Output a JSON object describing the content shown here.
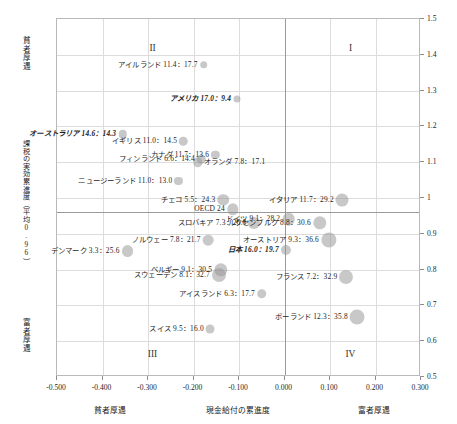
{
  "chart_data": {
    "type": "scatter",
    "title": "",
    "xlabel": "現金給付の累進度",
    "ylabel": "課税の実効累進度（平均0.96）",
    "xlim": [
      -0.5,
      0.3
    ],
    "ylim": [
      0.5,
      1.5
    ],
    "xticks": [
      "-0.500",
      "-0.400",
      "-0.300",
      "-0.200",
      "-0.100",
      "0.000",
      "0.100",
      "0.200",
      "0.300"
    ],
    "xtick_values": [
      -0.5,
      -0.4,
      -0.3,
      -0.2,
      -0.1,
      0.0,
      0.1,
      0.2,
      0.3
    ],
    "yticks": [
      "1.5",
      "1.4",
      "1.3",
      "1.2",
      "1.1",
      "1",
      "0.9",
      "0.8",
      "0.7",
      "0.6",
      "0.5"
    ],
    "ytick_values": [
      1.5,
      1.4,
      1.3,
      1.2,
      1.1,
      1.0,
      0.9,
      0.8,
      0.7,
      0.6,
      0.5
    ],
    "grid": true,
    "legend": "none",
    "reference_lines": {
      "x": 0.0,
      "y": 0.96
    },
    "axis_annotations": {
      "x_left": "貧者厚遇",
      "x_right": "富者厚遇",
      "y_top": "貧者厚遇",
      "y_bottom": "富者厚遇"
    },
    "quadrants": [
      {
        "label": "I",
        "x": 0.145,
        "y": 1.42
      },
      {
        "label": "II",
        "x": -0.29,
        "y": 1.42
      },
      {
        "label": "III",
        "x": -0.29,
        "y": 0.565
      },
      {
        "label": "IV",
        "x": 0.145,
        "y": 0.565
      }
    ],
    "points": [
      {
        "name": "アイルランド",
        "v1": "11.4",
        "v2": "17.7",
        "label": "アイルランド 11.4：17.7",
        "x": -0.178,
        "y": 1.372,
        "size": 11.4,
        "align": "right",
        "bold": false
      },
      {
        "name": "アメリカ",
        "v1": "17.0",
        "v2": "9.4",
        "label": "アメリカ 17.0：9.4",
        "x": -0.105,
        "y": 1.277,
        "size": 9.4,
        "align": "right",
        "bold": true
      },
      {
        "name": "オーストラリア",
        "v1": "14.6",
        "v2": "14.3",
        "label": "オーストラリア 14.6：14.3",
        "x": -0.356,
        "y": 1.178,
        "size": 14.3,
        "align": "right",
        "bold": true
      },
      {
        "name": "イギリス",
        "v1": "11.0",
        "v2": "14.5",
        "label": "イギリス 11.0：14.5",
        "x": -0.222,
        "y": 1.158,
        "size": 14.5,
        "align": "right",
        "bold": false
      },
      {
        "name": "カナダ",
        "v1": "11.7",
        "v2": "13.6",
        "label": "カナダ 11.7：13.6",
        "x": -0.152,
        "y": 1.121,
        "size": 13.6,
        "align": "right",
        "bold": false
      },
      {
        "name": "フィンランド",
        "v1": "6.6",
        "v2": "14.4",
        "label": "フィンランド 6.6：14.4",
        "x": -0.183,
        "y": 1.108,
        "size": 14.4,
        "align": "right",
        "bold": false
      },
      {
        "name": "オランダ",
        "v1": "7.8",
        "v2": "17.1",
        "label": "オランダ 7.8：17.1",
        "x": -0.19,
        "y": 1.1,
        "size": 17.1,
        "align": "left",
        "bold": false
      },
      {
        "name": "ニュージーランド",
        "v1": "11.0",
        "v2": "13.0",
        "label": "ニュージーランド 11.0：13.0",
        "x": -0.233,
        "y": 1.048,
        "size": 13.0,
        "align": "right",
        "bold": false
      },
      {
        "name": "チェコ",
        "v1": "5.5",
        "v2": "24.3",
        "label": "チェコ 5.5：24.3",
        "x": -0.135,
        "y": 0.995,
        "size": 24.3,
        "align": "right",
        "bold": false
      },
      {
        "name": "OECD",
        "v1": "24",
        "v2": "",
        "label": "OECD 24",
        "x": -0.114,
        "y": 0.968,
        "size": 24.0,
        "align": "right",
        "bold": false
      },
      {
        "name": "イタリア",
        "v1": "11.7",
        "v2": "29.2",
        "label": "イタリア 11.7：29.2",
        "x": 0.127,
        "y": 0.994,
        "size": 29.2,
        "align": "right",
        "bold": false
      },
      {
        "name": "ドイツ",
        "v1": "9.1",
        "v2": "28.2",
        "label": "ドイツ 9.1：28.2",
        "x": 0.009,
        "y": 0.94,
        "size": 28.2,
        "align": "right",
        "bold": false
      },
      {
        "name": "ルクセンブルク",
        "v1": "8.8",
        "v2": "30.6",
        "label": "ルクセンブルク 8.8：30.6",
        "x": 0.077,
        "y": 0.93,
        "size": 30.6,
        "align": "right",
        "bold": false
      },
      {
        "name": "スロバキア",
        "v1": "7.3",
        "v2": "26.0",
        "label": "スロバキア 7.3：26.0",
        "x": -0.066,
        "y": 0.93,
        "size": 26.0,
        "align": "right",
        "bold": false
      },
      {
        "name": "オーストリア",
        "v1": "9.3",
        "v2": "36.6",
        "label": "オーストリア 9.3：36.6",
        "x": 0.097,
        "y": 0.884,
        "size": 36.6,
        "align": "right",
        "bold": false
      },
      {
        "name": "ノルウェー",
        "v1": "7.8",
        "v2": "21.7",
        "label": "ノルウェー 7.8：21.7",
        "x": -0.168,
        "y": 0.882,
        "size": 21.7,
        "align": "right",
        "bold": false
      },
      {
        "name": "デンマーク",
        "v1": "3.3",
        "v2": "25.6",
        "label": "デンマーク 3.3：25.6",
        "x": -0.345,
        "y": 0.853,
        "size": 25.6,
        "align": "right",
        "bold": false
      },
      {
        "name": "日本",
        "v1": "16.0",
        "v2": "19.7",
        "label": "日本 16.0：19.7",
        "x": 0.003,
        "y": 0.855,
        "size": 19.7,
        "align": "right",
        "bold": true
      },
      {
        "name": "ベルギー",
        "v1": "9.1",
        "v2": "30.5",
        "label": "ベルギー 9.1：30.5",
        "x": -0.14,
        "y": 0.8,
        "size": 30.5,
        "align": "right",
        "bold": false
      },
      {
        "name": "スウェーデン",
        "v1": "8.1",
        "v2": "32.7",
        "label": "スウェーデン 8.1：32.7",
        "x": -0.144,
        "y": 0.785,
        "size": 32.7,
        "align": "right",
        "bold": false
      },
      {
        "name": "フランス",
        "v1": "7.2",
        "v2": "32.9",
        "label": "フランス 7.2：32.9",
        "x": 0.136,
        "y": 0.78,
        "size": 32.9,
        "align": "right",
        "bold": false
      },
      {
        "name": "アイスランド",
        "v1": "6.3",
        "v2": "17.7",
        "label": "アイスランド 6.3：17.7",
        "x": -0.05,
        "y": 0.732,
        "size": 17.7,
        "align": "right",
        "bold": false
      },
      {
        "name": "ポーランド",
        "v1": "12.3",
        "v2": "35.8",
        "label": "ポーランド 12.3：35.8",
        "x": 0.16,
        "y": 0.668,
        "size": 35.8,
        "align": "right",
        "bold": false
      },
      {
        "name": "スイス",
        "v1": "9.5",
        "v2": "16.0",
        "label": "スイス 9.5：16.0",
        "x": -0.163,
        "y": 0.633,
        "size": 16.0,
        "align": "right",
        "bold": false
      }
    ],
    "colors": {
      "bubble": "#969696",
      "grid": "#dcdcdc",
      "axis": "#9a9a9a",
      "text": "#1a1a1a"
    }
  }
}
